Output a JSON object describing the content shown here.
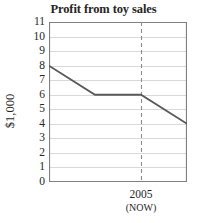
{
  "chart_data": {
    "type": "line",
    "title": "Profit from toy sales",
    "xlabel": "",
    "ylabel": "$1,000",
    "ylim": [
      0,
      11
    ],
    "yticks": [
      0,
      1,
      2,
      3,
      4,
      5,
      6,
      7,
      8,
      9,
      10,
      11
    ],
    "ytick_labels": [
      "0",
      "1",
      "2",
      "3",
      "4",
      "5",
      "6",
      "7",
      "8",
      "9",
      "10",
      "11"
    ],
    "grid": true,
    "legend": "none",
    "xlim": [
      0,
      6
    ],
    "xticks": [
      0,
      1,
      2,
      3,
      4,
      5,
      6
    ],
    "xtick_labels": [
      "",
      "",
      "",
      "",
      "2005",
      "",
      ""
    ],
    "x_annotation_primary": "2005",
    "x_annotation_secondary": "(NOW)",
    "x_annotation_at": 4,
    "series": [
      {
        "name": "Profit",
        "x": [
          0,
          2,
          4,
          6
        ],
        "values": [
          8,
          6,
          6,
          4
        ]
      }
    ],
    "reference_line": {
      "orientation": "vertical",
      "x": 4,
      "style": "dashed",
      "label": "2005"
    },
    "colors": {
      "line": "#595959",
      "grid": "#d9d9d9",
      "axis": "#808080",
      "text": "#262626",
      "dashed": "#8c8c8c",
      "background": "#ffffff"
    }
  }
}
